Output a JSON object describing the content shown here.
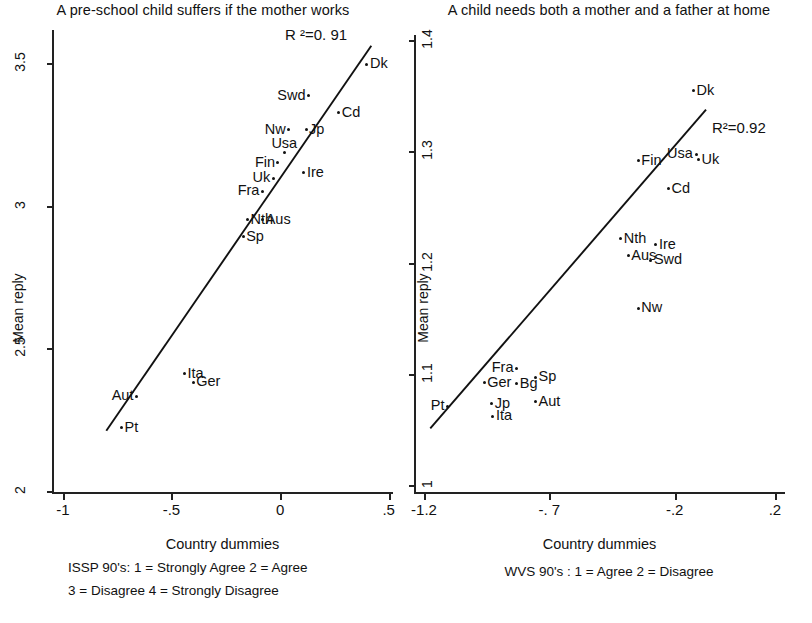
{
  "figure": {
    "background": "#ffffff",
    "ink_color": "#111111"
  },
  "panels": [
    {
      "id": "left",
      "title": "A pre-school child suffers if the mother works",
      "r2_label": "R ²=0. 91",
      "axis": {
        "xlabel": "Country dummies",
        "ylabel": "Mean reply",
        "xticks": [
          "-1",
          "-.5",
          "0",
          ".5"
        ],
        "xtick_values": [
          -1,
          -0.5,
          0,
          0.5
        ],
        "yticks": [
          "2",
          "2.5",
          "3",
          "3.5"
        ],
        "ytick_values": [
          2,
          2.5,
          3,
          3.5
        ],
        "xlim": [
          -1.05,
          0.52
        ],
        "ylim": [
          2.0,
          3.62
        ]
      },
      "caption_lines": [
        "ISSP 90's: 1 = Strongly Agree  2 = Agree",
        "3 = Disagree  4 = Strongly Disagree"
      ]
    },
    {
      "id": "right",
      "title": "A child needs both a mother and a father at home",
      "r2_label": "R²=0.92",
      "axis": {
        "xlabel": "Country dummies",
        "ylabel": "Mean reply",
        "xticks": [
          "-1.2",
          "-. 7",
          "-.2",
          ".2"
        ],
        "xtick_values": [
          -1.2,
          -0.7,
          -0.2,
          0.2
        ],
        "yticks": [
          "1",
          "1.1",
          "1.2",
          "1.3",
          "1.4"
        ],
        "ytick_values": [
          1,
          1.1,
          1.2,
          1.3,
          1.4
        ],
        "xlim": [
          -1.24,
          0.24
        ],
        "ylim": [
          0.995,
          1.405
        ]
      },
      "caption_lines": [
        "WVS 90's  : 1 = Agree  2 = Disagree"
      ]
    }
  ],
  "chart_data": [
    {
      "type": "scatter",
      "panel": "left",
      "title": "A pre-school child suffers if the mother works",
      "xlabel": "Country dummies",
      "ylabel": "Mean reply",
      "xlim": [
        -1.05,
        0.52
      ],
      "ylim": [
        2.0,
        3.62
      ],
      "grid": false,
      "legend": "none",
      "annotations": [
        "R ²=0. 91"
      ],
      "r_squared": 0.91,
      "fit_line": {
        "x0": -0.8,
        "y0": 2.215,
        "x1": 0.42,
        "y1": 3.565
      },
      "points": [
        {
          "label": "Dk",
          "x": 0.4,
          "y": 3.5,
          "label_pos": "right"
        },
        {
          "label": "Swd",
          "x": 0.13,
          "y": 3.39,
          "label_pos": "left"
        },
        {
          "label": "Cd",
          "x": 0.27,
          "y": 3.33,
          "label_pos": "right"
        },
        {
          "label": "Jp",
          "x": 0.12,
          "y": 3.27,
          "label_pos": "right"
        },
        {
          "label": "Nw",
          "x": 0.04,
          "y": 3.27,
          "label_pos": "left"
        },
        {
          "label": "Usa",
          "x": 0.02,
          "y": 3.19,
          "label_pos": "above"
        },
        {
          "label": "Fin",
          "x": -0.01,
          "y": 3.155,
          "label_pos": "left"
        },
        {
          "label": "Ire",
          "x": 0.11,
          "y": 3.12,
          "label_pos": "right"
        },
        {
          "label": "Uk",
          "x": -0.03,
          "y": 3.1,
          "label_pos": "left"
        },
        {
          "label": "Fra",
          "x": -0.08,
          "y": 3.055,
          "label_pos": "left"
        },
        {
          "label": "Nth",
          "x": -0.15,
          "y": 2.955,
          "label_pos": "right"
        },
        {
          "label": "Aus",
          "x": -0.08,
          "y": 2.955,
          "label_pos": "right"
        },
        {
          "label": "Sp",
          "x": -0.17,
          "y": 2.895,
          "label_pos": "right"
        },
        {
          "label": "Ita",
          "x": -0.44,
          "y": 2.415,
          "label_pos": "right"
        },
        {
          "label": "Ger",
          "x": -0.4,
          "y": 2.385,
          "label_pos": "right"
        },
        {
          "label": "Aut",
          "x": -0.66,
          "y": 2.335,
          "label_pos": "left"
        },
        {
          "label": "Pt",
          "x": -0.73,
          "y": 2.225,
          "label_pos": "right"
        }
      ]
    },
    {
      "type": "scatter",
      "panel": "right",
      "title": "A child needs both a mother and a father at home",
      "xlabel": "Country dummies",
      "ylabel": "Mean reply",
      "xlim": [
        -1.24,
        0.24
      ],
      "ylim": [
        0.995,
        1.405
      ],
      "grid": false,
      "legend": "none",
      "annotations": [
        "R²=0.92"
      ],
      "r_squared": 0.92,
      "fit_line": {
        "x0": -1.175,
        "y0": 1.052,
        "x1": -0.075,
        "y1": 1.338
      },
      "points": [
        {
          "label": "Dk",
          "x": -0.125,
          "y": 1.355,
          "label_pos": "right"
        },
        {
          "label": "Usa",
          "x": -0.115,
          "y": 1.298,
          "label_pos": "left"
        },
        {
          "label": "Uk",
          "x": -0.105,
          "y": 1.293,
          "label_pos": "right"
        },
        {
          "label": "Fin",
          "x": -0.345,
          "y": 1.292,
          "label_pos": "right"
        },
        {
          "label": "Cd",
          "x": -0.225,
          "y": 1.267,
          "label_pos": "right"
        },
        {
          "label": "Nth",
          "x": -0.415,
          "y": 1.222,
          "label_pos": "right"
        },
        {
          "label": "Ire",
          "x": -0.275,
          "y": 1.217,
          "label_pos": "right"
        },
        {
          "label": "Aus",
          "x": -0.385,
          "y": 1.207,
          "label_pos": "right"
        },
        {
          "label": "Swd",
          "x": -0.295,
          "y": 1.203,
          "label_pos": "right"
        },
        {
          "label": "Nw",
          "x": -0.345,
          "y": 1.16,
          "label_pos": "right"
        },
        {
          "label": "Fra",
          "x": -0.83,
          "y": 1.106,
          "label_pos": "left"
        },
        {
          "label": "Sp",
          "x": -0.755,
          "y": 1.098,
          "label_pos": "right"
        },
        {
          "label": "Ger",
          "x": -0.96,
          "y": 1.093,
          "label_pos": "right"
        },
        {
          "label": "Bg",
          "x": -0.83,
          "y": 1.092,
          "label_pos": "right"
        },
        {
          "label": "Aut",
          "x": -0.755,
          "y": 1.076,
          "label_pos": "right"
        },
        {
          "label": "Jp",
          "x": -0.93,
          "y": 1.074,
          "label_pos": "right"
        },
        {
          "label": "Pt",
          "x": -1.105,
          "y": 1.072,
          "label_pos": "left"
        },
        {
          "label": "Ita",
          "x": -0.925,
          "y": 1.063,
          "label_pos": "right"
        }
      ]
    }
  ]
}
